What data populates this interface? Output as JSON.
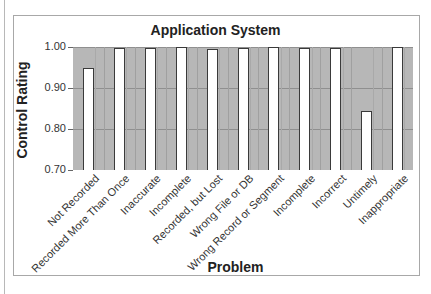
{
  "chart_data": {
    "type": "bar",
    "title": "Application System",
    "xlabel": "Problem",
    "ylabel": "Control Rating",
    "ylim": [
      0.7,
      1.0
    ],
    "yticks": [
      "0.70",
      "0.80",
      "0.90",
      "1.00"
    ],
    "grid": true,
    "legend": null,
    "categories": [
      "Not Recorded",
      "Recorded More Than Once",
      "Inaccurate",
      "Incomplete",
      "Recorded, but Lost",
      "Wrong File or DB",
      "Wrong Record or Segment",
      "Incomplete",
      "Incorrect",
      "Untimely",
      "Inappropriate"
    ],
    "values": [
      0.95,
      0.998,
      0.997,
      1.0,
      0.995,
      0.997,
      1.0,
      0.997,
      0.998,
      0.845,
      1.0
    ]
  },
  "colors": {
    "plot_background": "#b7b7b7",
    "bar_fill": "#ffffff",
    "bar_border": "#3a3a3a"
  }
}
